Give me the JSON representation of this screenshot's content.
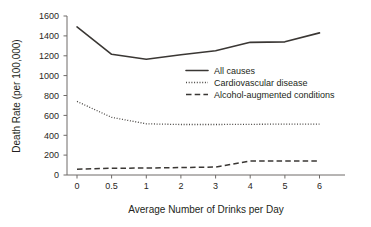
{
  "chart_data": {
    "type": "line",
    "title": "",
    "xlabel": "Average Number of Drinks per Day",
    "ylabel": "Death Rate (per 100,000)",
    "categories": [
      "0",
      "0.5",
      "1",
      "2",
      "3",
      "4",
      "5",
      "6"
    ],
    "x_tick_labels": [
      "0",
      "0.5",
      "1",
      "2",
      "3",
      "4",
      "5",
      "6"
    ],
    "y_tick_labels": [
      "0",
      "200",
      "400",
      "600",
      "800",
      "1000",
      "1200",
      "1400",
      "1600"
    ],
    "ylim": [
      0,
      1600
    ],
    "y_tick_step": 200,
    "grid": false,
    "legend_position": "center-right",
    "series": [
      {
        "name": "All causes",
        "style": "solid",
        "values": [
          1490,
          1215,
          1165,
          1210,
          1250,
          1335,
          1340,
          1430
        ]
      },
      {
        "name": "Cardiovascular disease",
        "style": "dotted",
        "values": [
          740,
          580,
          515,
          508,
          508,
          510,
          512,
          512
        ]
      },
      {
        "name": "Alcohol-augmented conditions",
        "style": "dashed",
        "values": [
          58,
          68,
          70,
          75,
          80,
          140,
          140,
          140
        ]
      }
    ]
  },
  "legend": {
    "entries": [
      {
        "label": "All causes",
        "style": "solid"
      },
      {
        "label": "Cardiovascular disease",
        "style": "dotted"
      },
      {
        "label": "Alcohol-augmented conditions",
        "style": "dashed"
      }
    ]
  }
}
